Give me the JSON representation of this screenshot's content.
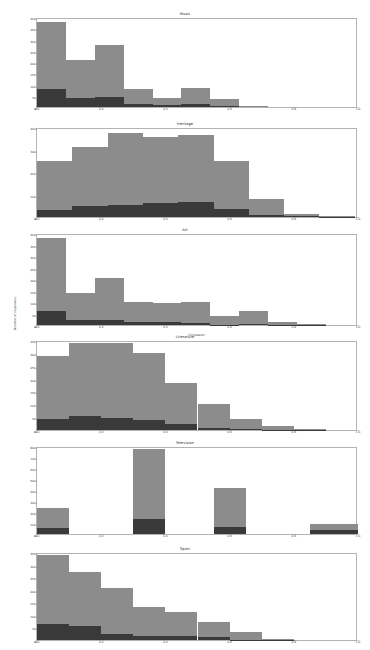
{
  "figure": {
    "width": 370,
    "height": 650,
    "background": "#ffffff",
    "axes_bg": "#ffffff",
    "axes_border": "#b3b3b3",
    "series_colors": {
      "upper": "#8c8c8c",
      "lower": "#3a3a3a"
    },
    "shared_ylabel": "Number of responses",
    "shared_xlabel": "Correlation"
  },
  "chart_data": {
    "type": "bar",
    "title": "Music",
    "xlabel": "Correlation",
    "ylabel": "Number of responses",
    "grid": false,
    "legend": "none",
    "xlim": [
      0.0,
      1.0
    ],
    "xticks": [
      0.0,
      0.2,
      0.4,
      0.6,
      0.8,
      1.0
    ],
    "xticklabels": [
      "0.0",
      "0.2",
      "0.4",
      "0.6",
      "0.8",
      "1.0"
    ],
    "panels": [
      {
        "title": "Music",
        "ylim": [
          0,
          400
        ],
        "yticks": [
          0,
          50,
          100,
          150,
          200,
          250,
          300,
          350,
          400
        ],
        "yticklabels": [
          "0",
          "50",
          "100",
          "150",
          "200",
          "250",
          "300",
          "350",
          "400"
        ],
        "bin_edges": [
          0.0,
          0.09,
          0.18,
          0.27,
          0.36,
          0.45,
          0.54,
          0.63,
          0.72,
          0.81,
          0.9
        ],
        "series": [
          {
            "name": "lower",
            "values": [
              78,
              41,
              44,
              12,
              11,
              13,
              5,
              0,
              0,
              0
            ]
          },
          {
            "name": "upper",
            "values": [
              302,
              167,
              230,
              68,
              28,
              70,
              29,
              4,
              0,
              0
            ]
          }
        ],
        "totals": [
          380,
          208,
          274,
          80,
          39,
          83,
          34,
          4,
          0,
          0
        ]
      },
      {
        "title": "Heritage",
        "ylim": [
          0,
          400
        ],
        "yticks": [
          0,
          100,
          200,
          300,
          400
        ],
        "yticklabels": [
          "0",
          "100",
          "200",
          "300",
          "400"
        ],
        "bin_edges": [
          0.0,
          0.11,
          0.22,
          0.33,
          0.44,
          0.55,
          0.66,
          0.77,
          0.88,
          0.99
        ],
        "series": [
          {
            "name": "lower",
            "values": [
              31,
              50,
              52,
              62,
              67,
              35,
              9,
              3,
              1
            ]
          },
          {
            "name": "upper",
            "values": [
              219,
              261,
              321,
              293,
              297,
              213,
              72,
              10,
              2
            ]
          }
        ],
        "totals": [
          250,
          311,
          373,
          355,
          364,
          248,
          81,
          13,
          3
        ]
      },
      {
        "title": "Art",
        "ylim": [
          0,
          400
        ],
        "yticks": [
          0,
          50,
          100,
          150,
          200,
          250,
          300,
          350,
          400
        ],
        "yticklabels": [
          "0",
          "50",
          "100",
          "150",
          "200",
          "250",
          "300",
          "350",
          "400"
        ],
        "bin_edges": [
          0.0,
          0.09,
          0.18,
          0.27,
          0.36,
          0.45,
          0.54,
          0.63,
          0.72,
          0.81,
          0.9
        ],
        "series": [
          {
            "name": "lower",
            "values": [
              60,
              22,
              23,
              12,
              12,
              10,
              2,
              3,
              2,
              1
            ]
          },
          {
            "name": "upper",
            "values": [
              320,
              119,
              180,
              90,
              83,
              88,
              38,
              56,
              10,
              3
            ]
          }
        ],
        "totals": [
          380,
          141,
          203,
          102,
          95,
          98,
          40,
          59,
          12,
          4
        ]
      },
      {
        "title": "Literature",
        "ylim": [
          0,
          350
        ],
        "yticks": [
          0,
          50,
          100,
          150,
          200,
          250,
          300,
          350
        ],
        "yticklabels": [
          "0",
          "50",
          "100",
          "150",
          "200",
          "250",
          "300",
          "350"
        ],
        "bin_edges": [
          0.0,
          0.1,
          0.2,
          0.3,
          0.4,
          0.5,
          0.6,
          0.7,
          0.8,
          0.9
        ],
        "series": [
          {
            "name": "lower",
            "values": [
              42,
              54,
              48,
              40,
              22,
              8,
              3,
              1,
              1,
              2
            ]
          },
          {
            "name": "upper",
            "values": [
              246,
              283,
              292,
              261,
              162,
              92,
              38,
              13,
              2,
              3
            ]
          }
        ],
        "totals": [
          288,
          337,
          340,
          301,
          184,
          100,
          41,
          14,
          3,
          5
        ]
      },
      {
        "title": "Television",
        "ylim": [
          0,
          800
        ],
        "yticks": [
          0,
          100,
          200,
          300,
          400,
          500,
          600,
          700,
          800
        ],
        "yticklabels": [
          "0",
          "100",
          "200",
          "300",
          "400",
          "500",
          "600",
          "700",
          "800"
        ],
        "bin_edges": [
          0.0,
          0.1,
          0.3,
          0.4,
          0.55,
          0.65,
          0.85,
          1.0
        ],
        "series": [
          {
            "name": "lower",
            "values": [
              58,
              0,
              140,
              0,
              60,
              0,
              36
            ]
          },
          {
            "name": "upper",
            "values": [
              177,
              0,
              637,
              0,
              360,
              0,
              54
            ]
          }
        ],
        "totals": [
          235,
          0,
          777,
          0,
          420,
          0,
          90
        ]
      },
      {
        "title": "Sport",
        "ylim": [
          0,
          350
        ],
        "yticks": [
          0,
          50,
          100,
          150,
          200,
          250,
          300,
          350
        ],
        "yticklabels": [
          "0",
          "50",
          "100",
          "150",
          "200",
          "250",
          "300",
          "350"
        ],
        "bin_edges": [
          0.0,
          0.1,
          0.2,
          0.3,
          0.4,
          0.5,
          0.6,
          0.7,
          0.8,
          0.9
        ],
        "series": [
          {
            "name": "lower",
            "values": [
              62,
              56,
              24,
              14,
              15,
              12,
              2,
              1,
              0,
              0
            ]
          },
          {
            "name": "upper",
            "values": [
              278,
              216,
              181,
              116,
              98,
              60,
              28,
              3,
              0,
              0
            ]
          }
        ],
        "totals": [
          340,
          272,
          205,
          130,
          113,
          72,
          30,
          4,
          0,
          0
        ]
      }
    ]
  }
}
